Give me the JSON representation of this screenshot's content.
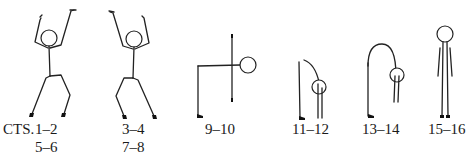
{
  "figures": [
    {
      "id": "arms-up-lean-left",
      "pose": "jumping jack, arms raised, knees bent"
    },
    {
      "id": "arms-up-lean-right",
      "pose": "jumping jack, arms raised, knees bent (mirrored)"
    },
    {
      "id": "forward-bend-90",
      "pose": "bent at waist, torso horizontal, arms extended vertically"
    },
    {
      "id": "forward-bend-hang",
      "pose": "bent forward, head hanging"
    },
    {
      "id": "deep-forward-bend",
      "pose": "rolled down, head near knees"
    },
    {
      "id": "standing-upright",
      "pose": "standing upright, arms at sides"
    }
  ],
  "labels": {
    "prefix": "CTS.",
    "fig1_line1": "1–2",
    "fig1_line2": "5–6",
    "fig2_line1": "3–4",
    "fig2_line2": "7–8",
    "fig3": "9–10",
    "fig4": "11–12",
    "fig5": "13–14",
    "fig6": "15–16"
  }
}
